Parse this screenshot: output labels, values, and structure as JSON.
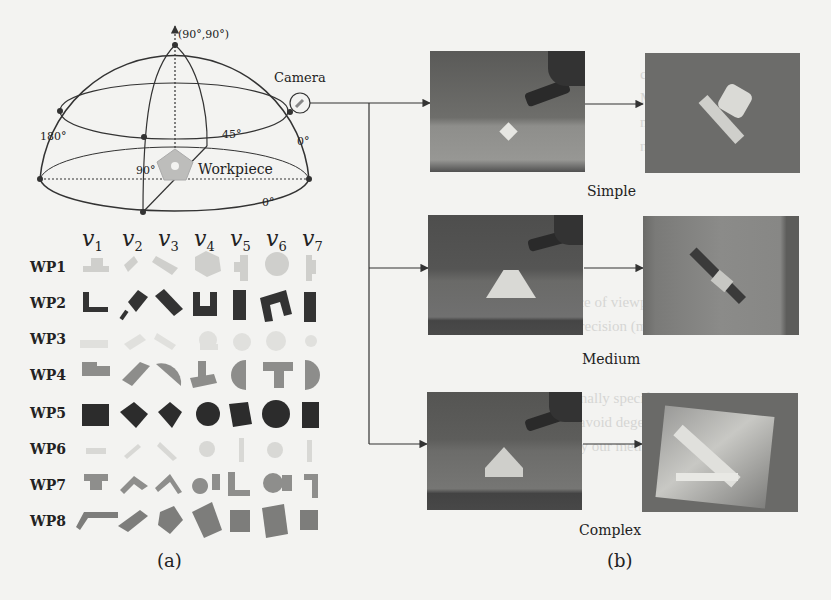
{
  "figure": {
    "panel_a": {
      "caption": "(a)",
      "hemisphere": {
        "top_label": "(90°,90°)",
        "camera_label": "Camera",
        "workpiece_label": "Workpiece",
        "angle_labels": {
          "left": "180°",
          "right": "0°",
          "elev_45": "45°",
          "inner_90": "90°",
          "bottom_0": "0°"
        }
      },
      "grid": {
        "columns": [
          "v1",
          "v2",
          "v3",
          "v4",
          "v5",
          "v6",
          "v7"
        ],
        "column_subscripts": [
          "1",
          "2",
          "3",
          "4",
          "5",
          "6",
          "7"
        ],
        "rows": [
          "WP1",
          "WP2",
          "WP3",
          "WP4",
          "WP5",
          "WP6",
          "WP7",
          "WP8"
        ],
        "row_colors": [
          "#cfcfcc",
          "#3a3a3a",
          "#e2e2df",
          "#8d8d8b",
          "#2c2c2c",
          "#dadad7",
          "#8e8e8c",
          "#7d7d7b"
        ]
      }
    },
    "panel_b": {
      "caption": "(b)",
      "scenes": [
        {
          "label": "Simple"
        },
        {
          "label": "Medium"
        },
        {
          "label": "Complex"
        }
      ]
    }
  }
}
